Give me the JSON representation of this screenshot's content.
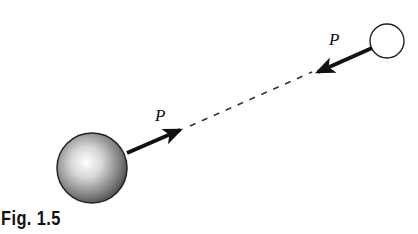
{
  "figure": {
    "caption": "Fig. 1.5",
    "large_body": {
      "label": "large-sphere",
      "cx": 92,
      "cy": 168,
      "r": 35,
      "shading": "gray-gradient"
    },
    "small_body": {
      "label": "small-sphere",
      "cx": 387,
      "cy": 41,
      "r": 17,
      "fill": "#ffffff"
    },
    "forces": [
      {
        "label": "P",
        "from": [
          127,
          153
        ],
        "to": [
          180,
          130
        ],
        "label_pos": [
          155,
          121
        ]
      },
      {
        "label": "P",
        "from": [
          372,
          48
        ],
        "to": [
          318,
          72
        ],
        "label_pos": [
          329,
          45
        ]
      }
    ],
    "line_of_action": {
      "style": "dashed",
      "from": [
        190,
        126
      ],
      "to": [
        312,
        72
      ]
    }
  },
  "colors": {
    "ink": "#111111",
    "background": "#ffffff"
  }
}
